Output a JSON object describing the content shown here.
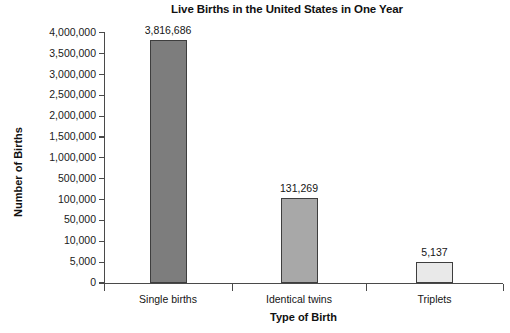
{
  "chart_data": {
    "type": "bar",
    "title": "Live Births in the United States in One Year",
    "xlabel": "Type of Birth",
    "ylabel": "Number of Births",
    "categories": [
      "Single births",
      "Identical twins",
      "Triplets"
    ],
    "values": [
      3816686,
      131269,
      5137
    ],
    "value_labels": [
      "3,816,686",
      "131,269",
      "5,137"
    ],
    "bar_colors": [
      "#7d7d7d",
      "#a8a8a8",
      "#e9e9e9"
    ],
    "bar_border_color": "#3e3e3e",
    "axis_color": "#4a4a4a",
    "grid": false,
    "legend": "none",
    "y_scale_note": "broken / non-linear axis",
    "y_ticks": [
      {
        "value": 4000000,
        "label": "4,000,000"
      },
      {
        "value": 3500000,
        "label": "3,500,000"
      },
      {
        "value": 3000000,
        "label": "3,000,000"
      },
      {
        "value": 2500000,
        "label": "2,500,000"
      },
      {
        "value": 2000000,
        "label": "2,000,000"
      },
      {
        "value": 1500000,
        "label": "1,500,000"
      },
      {
        "value": 1000000,
        "label": "1,000,000"
      },
      {
        "value": 500000,
        "label": "500,000"
      },
      {
        "value": 100000,
        "label": "100,000"
      },
      {
        "value": 50000,
        "label": "50,000"
      },
      {
        "value": 10000,
        "label": "10,000"
      },
      {
        "value": 5000,
        "label": "5,000"
      },
      {
        "value": 0,
        "label": "0"
      }
    ],
    "ylim": [
      0,
      4000000
    ]
  }
}
